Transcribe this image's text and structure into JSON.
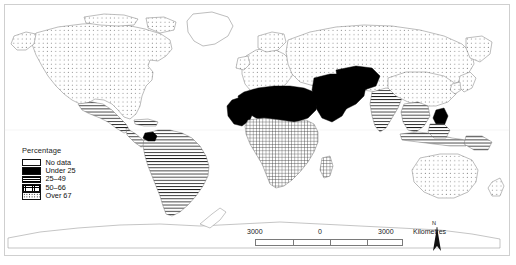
{
  "map": {
    "title": "World choropleth map",
    "projection": "world",
    "background_color": "#ffffff",
    "outline_color": "#6b6b6b",
    "frame_color": "#cfcfcf"
  },
  "legend": {
    "title": "Percentage",
    "items": [
      {
        "label": "No data",
        "pattern": "blank",
        "swatch_class": "sw-nodata"
      },
      {
        "label": "Under 25",
        "pattern": "solid-black",
        "swatch_class": "sw-under25"
      },
      {
        "label": "25–49",
        "pattern": "horizontal-lines",
        "swatch_class": "sw-2549"
      },
      {
        "label": "50–66",
        "pattern": "fine-grid",
        "swatch_class": "sw-5066"
      },
      {
        "label": "Over 67",
        "pattern": "dots",
        "swatch_class": "sw-over67"
      }
    ]
  },
  "scale_bar": {
    "left_value": "3000",
    "center_value": "0",
    "right_value": "3000",
    "unit": "Kilometres"
  },
  "north_arrow": {
    "label": "N"
  },
  "regions": [
    {
      "name": "North America",
      "class": "Over 67"
    },
    {
      "name": "Greenland",
      "class": "No data"
    },
    {
      "name": "Mexico",
      "class": "25–49"
    },
    {
      "name": "Central America",
      "class": "25–49"
    },
    {
      "name": "South America",
      "class": "25–49"
    },
    {
      "name": "Ecuador / Peru",
      "class": "Under 25"
    },
    {
      "name": "Europe",
      "class": "Over 67"
    },
    {
      "name": "Russia / North Asia",
      "class": "Over 67"
    },
    {
      "name": "North Africa",
      "class": "Under 25"
    },
    {
      "name": "West Africa",
      "class": "Under 25"
    },
    {
      "name": "Arabian Peninsula",
      "class": "Under 25"
    },
    {
      "name": "Middle East",
      "class": "Under 25"
    },
    {
      "name": "Sub-Saharan Africa",
      "class": "50–66"
    },
    {
      "name": "Southern Africa",
      "class": "50–66"
    },
    {
      "name": "India",
      "class": "25–49"
    },
    {
      "name": "Southeast Asia",
      "class": "25–49"
    },
    {
      "name": "China",
      "class": "Over 67"
    },
    {
      "name": "Indonesia",
      "class": "25–49"
    },
    {
      "name": "Australia",
      "class": "Over 67"
    },
    {
      "name": "New Zealand",
      "class": "Over 67"
    },
    {
      "name": "Antarctica",
      "class": "No data"
    }
  ]
}
